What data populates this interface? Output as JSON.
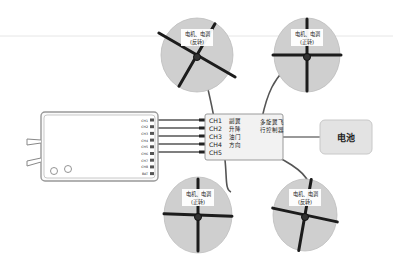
{
  "diagram": {
    "title": "",
    "colors": {
      "motor_disc": "#cfcfcf",
      "propeller": "#1c1c1c",
      "wire": "#555555",
      "box_fill": "#f2f2f2",
      "box_stroke": "#9a9a9a",
      "battery_fill": "#e3e3e3"
    },
    "motors": [
      {
        "id": "front-left",
        "label_line1": "电机、电调",
        "label_line2": "(反转)"
      },
      {
        "id": "front-right",
        "label_line1": "电机、电调",
        "label_line2": "(正转)"
      },
      {
        "id": "rear-left",
        "label_line1": "电机、电调",
        "label_line2": "(正转)"
      },
      {
        "id": "rear-right",
        "label_line1": "电机、电调",
        "label_line2": "(反转)"
      }
    ],
    "flight_controller": {
      "label_line1": "多旋翼飞",
      "label_line2": "行控制器",
      "channels": [
        {
          "ch": "CH1",
          "func": "副翼"
        },
        {
          "ch": "CH2",
          "func": "升降"
        },
        {
          "ch": "CH3",
          "func": "油门"
        },
        {
          "ch": "CH4",
          "func": "方向"
        },
        {
          "ch": "CH5",
          "func": ""
        }
      ]
    },
    "receiver": {
      "pins": [
        "CH1",
        "CH2",
        "CH3",
        "CH4",
        "CH5",
        "CH6",
        "CH7",
        "CH8",
        "BAT"
      ]
    },
    "battery": {
      "label": "电池"
    }
  }
}
